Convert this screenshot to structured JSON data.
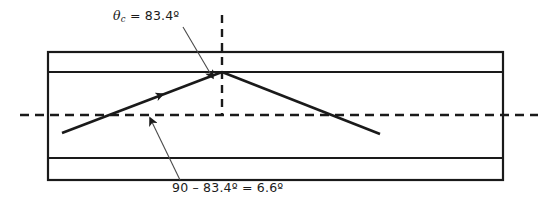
{
  "figure": {
    "width": 545,
    "height": 206,
    "background_color": "#ffffff",
    "line_color": "#1a1a1a",
    "leader_color": "#4a4a4a"
  },
  "labels": {
    "theta_critical": {
      "symbol": "θ",
      "subscript": "c",
      "equals": " = ",
      "value": "83.4º",
      "full_text": "θc = 83.4º"
    },
    "complement_angle": {
      "text": "90 – 83.4º = 6.6º"
    }
  },
  "waveguide": {
    "name": "fiber-cross-section",
    "left_x": 48,
    "right_x": 503,
    "outer_top_y": 52,
    "core_top_y": 72,
    "core_bottom_y": 158,
    "outer_bottom_y": 180,
    "stroke_width": 2.2
  },
  "axis": {
    "name": "optical-axis",
    "orientation": "horizontal-dashed",
    "y": 115,
    "x_start": 20,
    "x_end": 538,
    "dash": "9 6"
  },
  "normal": {
    "name": "surface-normal",
    "orientation": "vertical-dashed",
    "x": 222,
    "y_start": 15,
    "y_end": 116,
    "dash": "8 6"
  },
  "rays": {
    "incident": {
      "name": "incident-ray",
      "x1": 62,
      "y1": 133,
      "x2": 222,
      "y2": 72,
      "arrow_at": {
        "x": 160,
        "y": 95
      }
    },
    "reflected": {
      "name": "reflected-ray",
      "x1": 222,
      "y1": 72,
      "x2": 380,
      "y2": 134
    }
  },
  "leaders": [
    {
      "name": "theta-critical-leader",
      "x1": 183,
      "y1": 27,
      "x2": 213,
      "y2": 78
    },
    {
      "name": "complement-angle-leader",
      "x1": 180,
      "y1": 180,
      "x2": 149,
      "y2": 116
    }
  ]
}
